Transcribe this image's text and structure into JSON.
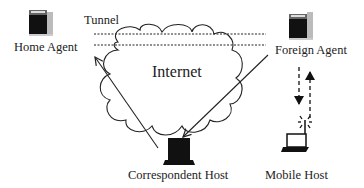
{
  "diagram": {
    "nodes": {
      "home_agent": {
        "label": "Home Agent",
        "icon": "server-icon"
      },
      "foreign_agent": {
        "label": "Foreign Agent",
        "icon": "server-icon"
      },
      "correspondent_host": {
        "label": "Correspondent Host",
        "icon": "desktop-computer-icon"
      },
      "mobile_host": {
        "label": "Mobile Host",
        "icon": "laptop-wireless-icon"
      },
      "internet": {
        "label": "Internet",
        "icon": "cloud-icon"
      }
    },
    "tunnel_label": "Tunnel",
    "edges": [
      {
        "from": "Correspondent Host",
        "to": "Foreign Agent",
        "style": "solid",
        "via": "Internet"
      },
      {
        "from": "Correspondent Host",
        "to": "Home Agent",
        "style": "solid",
        "via": "Internet"
      },
      {
        "from": "Home Agent",
        "to": "Foreign Agent",
        "style": "dotted-tunnel"
      },
      {
        "from": "Foreign Agent",
        "to": "Mobile Host",
        "style": "dashed"
      },
      {
        "from": "Mobile Host",
        "to": "Foreign Agent",
        "style": "dashed"
      }
    ],
    "colors": {
      "ink": "#222222",
      "background": "#ffffff"
    }
  }
}
